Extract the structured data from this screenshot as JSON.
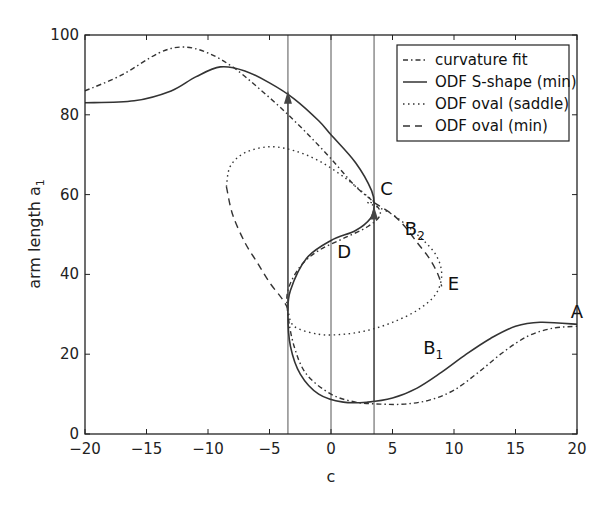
{
  "chart_data": {
    "type": "line",
    "title": "",
    "xlabel": "c",
    "ylabel": "arm length a",
    "ylabel_subscript": "1",
    "xlim": [
      -20,
      20
    ],
    "ylim": [
      0,
      100
    ],
    "xticks": [
      -20,
      -15,
      -10,
      -5,
      0,
      5,
      10,
      15,
      20
    ],
    "xtick_labels": [
      "−20",
      "−15",
      "−10",
      "−5",
      "0",
      "5",
      "10",
      "15",
      "20"
    ],
    "yticks": [
      0,
      20,
      40,
      60,
      80,
      100
    ],
    "ytick_labels": [
      "0",
      "20",
      "40",
      "60",
      "80",
      "100"
    ],
    "grid": false,
    "legend_position": "upper right",
    "vertical_lines": [
      -3.5,
      0,
      3.5
    ],
    "series": [
      {
        "name": "curvature fit",
        "style": "dash-dot",
        "x": [
          -20,
          -17,
          -14,
          -12,
          -10,
          -8,
          -6,
          -4,
          -2,
          0,
          2,
          3.5,
          4,
          3,
          1,
          -1,
          -2.5,
          -3.5,
          -3.5,
          -3,
          -2,
          0,
          2,
          4,
          6,
          8,
          10,
          12,
          14,
          16,
          18,
          20
        ],
        "y": [
          86,
          90,
          95.5,
          97,
          95.5,
          92,
          87,
          81.5,
          75.5,
          69,
          62,
          58,
          55,
          52,
          49,
          46,
          42,
          36,
          30,
          22,
          15,
          10,
          8,
          7.5,
          7.5,
          8.5,
          11,
          15.5,
          20.5,
          24.5,
          26.5,
          27
        ]
      },
      {
        "name": "ODF S-shape (min)",
        "style": "solid",
        "x": [
          -20,
          -16,
          -13,
          -11,
          -9,
          -7,
          -5,
          -3,
          -1,
          0,
          2,
          3.3,
          3.5,
          3.2,
          2,
          0,
          -2,
          -3.3,
          -3.5,
          -3.3,
          -2.5,
          -1,
          1,
          3,
          5,
          7,
          9,
          11,
          13,
          15,
          17,
          20
        ],
        "y": [
          83,
          83.5,
          86,
          89.5,
          92,
          91,
          88,
          84,
          78.5,
          75,
          68,
          61,
          57,
          54,
          51,
          48.5,
          44,
          36,
          30,
          22,
          15,
          10,
          8,
          8,
          9,
          11.5,
          15.5,
          20,
          24,
          27,
          28,
          27.5
        ]
      },
      {
        "name": "ODF oval (saddle)",
        "style": "dotted",
        "x": [
          -8.5,
          -8.2,
          -7,
          -5,
          -3,
          -1,
          1,
          3,
          3.5,
          3,
          5,
          7,
          8.5,
          9,
          8.5,
          7,
          5,
          3,
          1,
          -1,
          -3,
          -3.5
        ],
        "y": [
          62,
          67,
          70.5,
          72,
          71,
          68.5,
          64.5,
          59.5,
          58,
          58,
          55,
          50,
          45,
          40,
          35,
          31,
          28,
          26,
          25,
          25,
          27,
          31
        ]
      },
      {
        "name": "ODF oval (min)",
        "style": "dashed",
        "x": [
          -8.5,
          -8,
          -7,
          -6,
          -5,
          -4,
          -3.5,
          null,
          3.5,
          5,
          6,
          7,
          8,
          8.7,
          9
        ],
        "y": [
          62,
          55,
          48,
          43,
          38,
          34,
          31.5,
          null,
          58,
          55,
          52,
          48,
          44,
          40,
          37
        ]
      }
    ],
    "arrows": [
      {
        "from": [
          -3.5,
          31
        ],
        "to": [
          -3.5,
          86
        ],
        "direction": "up"
      },
      {
        "from": [
          3.5,
          8
        ],
        "to": [
          3.5,
          57
        ],
        "direction": "up"
      }
    ],
    "annotations": [
      {
        "text": "A",
        "x": 19.5,
        "y": 29
      },
      {
        "text": "B",
        "sub": "1",
        "x": 7.5,
        "y": 20
      },
      {
        "text": "B",
        "sub": "2",
        "x": 6,
        "y": 50
      },
      {
        "text": "C",
        "x": 4,
        "y": 60
      },
      {
        "text": "D",
        "x": 0.5,
        "y": 44
      },
      {
        "text": "E",
        "x": 9.5,
        "y": 36
      }
    ]
  },
  "legend": {
    "items": [
      {
        "label": "curvature fit",
        "style": "dash-dot"
      },
      {
        "label": "ODF S-shape (min)",
        "style": "solid"
      },
      {
        "label": "ODF oval (saddle)",
        "style": "dotted"
      },
      {
        "label": "ODF oval (min)",
        "style": "dashed"
      }
    ]
  },
  "colors": {
    "line": "#333333",
    "axis": "#222222",
    "background": "#ffffff"
  }
}
